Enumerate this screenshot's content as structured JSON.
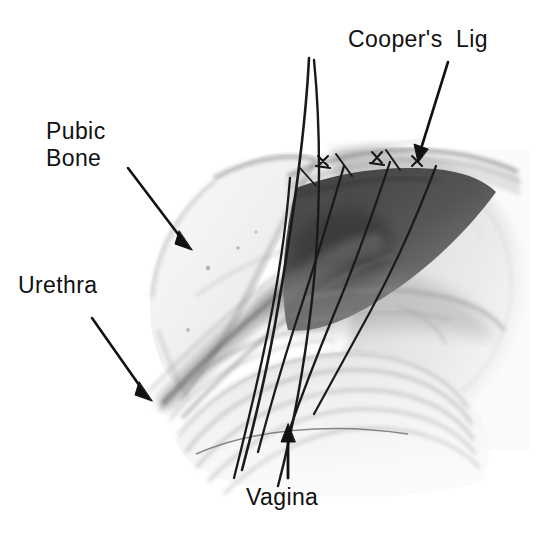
{
  "figure": {
    "background_color": "#ffffff",
    "ink_color": "#111111",
    "width": 540,
    "height": 534,
    "medium": "halftone pen-and-ink / wash medical illustration"
  },
  "labels": [
    {
      "id": "coopers-lig",
      "text": "Cooper's  Lig",
      "position": "top-right",
      "arrow": "diagonal down-left",
      "points_to": "iliopectineal (Cooper's) ligament band with suture knots"
    },
    {
      "id": "pubic-bone",
      "text": "Pubic\nBone",
      "line1": "Pubic",
      "line2": "Bone",
      "position": "upper-left",
      "arrow": "diagonal down-right",
      "points_to": "pubic symphysis / superior pubic ramus"
    },
    {
      "id": "urethra",
      "text": "Urethra",
      "position": "mid-left",
      "arrow": "diagonal down-right",
      "points_to": "urethra running along the anterior vaginal wall"
    },
    {
      "id": "vagina",
      "text": "Vagina",
      "position": "bottom-center",
      "arrow": "vertical up",
      "points_to": "anterior vaginal wall with rugae"
    }
  ],
  "structures": [
    {
      "name": "pubic-bone",
      "tone": "light",
      "description": "pale bone mass, upper left, stippled"
    },
    {
      "name": "retropubic-space",
      "tone": "dark",
      "description": "dark shaded space of Retzius, center"
    },
    {
      "name": "coopers-ligament",
      "tone": "mid",
      "description": "horizontal fibrous band, upper right"
    },
    {
      "name": "urethra",
      "tone": "mid-dark",
      "description": "tubular structure, lower left"
    },
    {
      "name": "vaginal-wall",
      "tone": "light",
      "description": "concentric rugae folds, bottom center"
    },
    {
      "name": "pelvic-sidewall",
      "tone": "light-mid",
      "description": "soft stippled tissue, right"
    }
  ],
  "sutures": {
    "count": 4,
    "color": "#1a1a1a",
    "description": "parallel suture threads passing from vaginal wall up to Cooper's ligament",
    "knots": 3,
    "free_ends": 2
  }
}
